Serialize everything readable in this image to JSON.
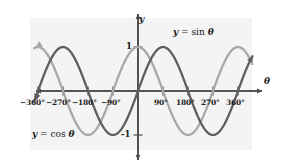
{
  "figure": {
    "background_color": "#f4f4f4",
    "axis_color": "#4d4d4d",
    "sin_color": "#5e5e5e",
    "cos_color": "#a8a8a8"
  },
  "axes": {
    "x_axis_name": "θ",
    "y_axis_name": "y",
    "y_value_labels": [
      {
        "text": "1",
        "value": 1
      },
      {
        "text": "-1",
        "value": -1
      }
    ],
    "x_tick_labels": [
      {
        "text": "−360°",
        "value": -360
      },
      {
        "text": "−270°",
        "value": -270
      },
      {
        "text": "−180°",
        "value": -180
      },
      {
        "text": "−90°",
        "value": -90
      },
      {
        "text": "90°",
        "value": 90
      },
      {
        "text": "180°",
        "value": 180
      },
      {
        "text": "270°",
        "value": 270
      },
      {
        "text": "360°",
        "value": 360
      }
    ]
  },
  "curve_labels": {
    "sin": {
      "lhs": "y",
      "eq": " = sin ",
      "arg": "θ"
    },
    "cos": {
      "lhs": "y",
      "eq": " = cos ",
      "arg": "θ"
    }
  },
  "chart_data": {
    "type": "line",
    "title": "",
    "xlabel": "θ",
    "ylabel": "y",
    "xlim": [
      -390,
      390
    ],
    "ylim": [
      -1.35,
      1.35
    ],
    "xticks": [
      -360,
      -270,
      -180,
      -90,
      90,
      180,
      270,
      360
    ],
    "yticks": [
      -1,
      1
    ],
    "grid": false,
    "legend": "inline-annotations",
    "series": [
      {
        "name": "y = sin θ",
        "color": "#5e5e5e",
        "equation": "sin",
        "amplitude": 1,
        "period": 360,
        "phase": 0,
        "key_points": [
          {
            "x": -360,
            "y": 0
          },
          {
            "x": -270,
            "y": 1
          },
          {
            "x": -180,
            "y": 0
          },
          {
            "x": -90,
            "y": -1
          },
          {
            "x": 0,
            "y": 0
          },
          {
            "x": 90,
            "y": 1
          },
          {
            "x": 180,
            "y": 0
          },
          {
            "x": 270,
            "y": -1
          },
          {
            "x": 360,
            "y": 0
          }
        ]
      },
      {
        "name": "y = cos θ",
        "color": "#a8a8a8",
        "equation": "cos",
        "amplitude": 1,
        "period": 360,
        "phase": 90,
        "key_points": [
          {
            "x": -360,
            "y": 1
          },
          {
            "x": -270,
            "y": 0
          },
          {
            "x": -180,
            "y": -1
          },
          {
            "x": -90,
            "y": 0
          },
          {
            "x": 0,
            "y": 1
          },
          {
            "x": 90,
            "y": 0
          },
          {
            "x": 180,
            "y": -1
          },
          {
            "x": 270,
            "y": 0
          },
          {
            "x": 360,
            "y": 1
          }
        ]
      }
    ]
  }
}
